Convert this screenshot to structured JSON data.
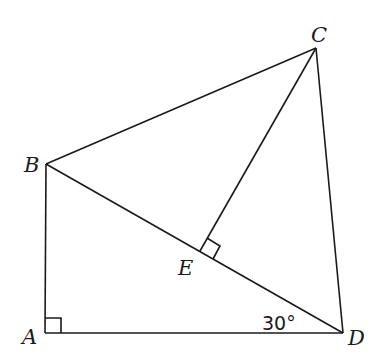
{
  "diagram": {
    "type": "geometry",
    "points": {
      "A": {
        "label": "A",
        "x": 45,
        "y": 333
      },
      "B": {
        "label": "B",
        "x": 46,
        "y": 164
      },
      "C": {
        "label": "C",
        "x": 316,
        "y": 48
      },
      "D": {
        "label": "D",
        "x": 343,
        "y": 333
      },
      "E": {
        "label": "E",
        "x": 200,
        "y": 251
      }
    },
    "segments": [
      "AB",
      "AD",
      "BC",
      "CD",
      "BD",
      "CE"
    ],
    "right_angles": [
      "A",
      "E"
    ],
    "angle_annotation": {
      "vertex": "D",
      "text": "30°"
    }
  }
}
